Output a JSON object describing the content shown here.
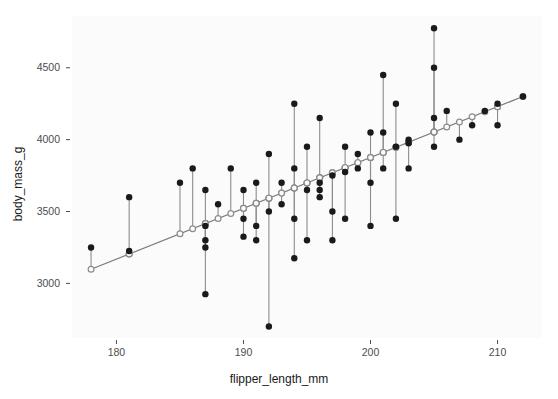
{
  "chart_data": {
    "type": "scatter",
    "title": "",
    "xlabel": "flipper_length_mm",
    "ylabel": "body_mass_g",
    "xlim": [
      176.5,
      213.5
    ],
    "ylim": [
      2620,
      4860
    ],
    "xticks": [
      180,
      190,
      200,
      210
    ],
    "yticks": [
      3000,
      3500,
      4000,
      4500
    ],
    "grid": false,
    "legend": null,
    "series": [
      {
        "name": "observed",
        "marker": "filled-circle",
        "color": "#1a1a1a"
      },
      {
        "name": "fitted",
        "marker": "open-circle",
        "color": "#8c8c8c"
      },
      {
        "name": "residual-segment",
        "marker": "line",
        "color": "#8c8c8c"
      }
    ],
    "regression_line": {
      "x_start": 178.0,
      "y_start": 3098,
      "x_end": 212.0,
      "y_end": 4300,
      "slope": 35.35,
      "intercept": -3194.0,
      "color": "#7a7a7a"
    },
    "points": [
      {
        "x": 178.0,
        "observed": 3250,
        "fitted": 3098
      },
      {
        "x": 181.0,
        "observed": 3600,
        "fitted": 3204
      },
      {
        "x": 181.0,
        "observed": 3225,
        "fitted": 3204
      },
      {
        "x": 185.0,
        "observed": 3700,
        "fitted": 3345
      },
      {
        "x": 186.0,
        "observed": 3800,
        "fitted": 3380
      },
      {
        "x": 187.0,
        "observed": 3650,
        "fitted": 3416
      },
      {
        "x": 187.0,
        "observed": 3400,
        "fitted": 3416
      },
      {
        "x": 187.0,
        "observed": 3300,
        "fitted": 3416
      },
      {
        "x": 187.0,
        "observed": 3250,
        "fitted": 3416
      },
      {
        "x": 187.0,
        "observed": 2925,
        "fitted": 3416
      },
      {
        "x": 188.0,
        "observed": 3550,
        "fitted": 3451
      },
      {
        "x": 189.0,
        "observed": 3800,
        "fitted": 3486
      },
      {
        "x": 190.0,
        "observed": 3650,
        "fitted": 3522
      },
      {
        "x": 190.0,
        "observed": 3450,
        "fitted": 3522
      },
      {
        "x": 190.0,
        "observed": 3325,
        "fitted": 3522
      },
      {
        "x": 191.0,
        "observed": 3700,
        "fitted": 3557
      },
      {
        "x": 191.0,
        "observed": 3400,
        "fitted": 3557
      },
      {
        "x": 191.0,
        "observed": 3300,
        "fitted": 3557
      },
      {
        "x": 192.0,
        "observed": 3900,
        "fitted": 3593
      },
      {
        "x": 192.0,
        "observed": 3500,
        "fitted": 3593
      },
      {
        "x": 192.0,
        "observed": 2700,
        "fitted": 3593
      },
      {
        "x": 193.0,
        "observed": 3700,
        "fitted": 3628
      },
      {
        "x": 193.0,
        "observed": 3550,
        "fitted": 3628
      },
      {
        "x": 194.0,
        "observed": 4250,
        "fitted": 3663
      },
      {
        "x": 194.0,
        "observed": 3800,
        "fitted": 3663
      },
      {
        "x": 194.0,
        "observed": 3450,
        "fitted": 3663
      },
      {
        "x": 194.0,
        "observed": 3175,
        "fitted": 3663
      },
      {
        "x": 195.0,
        "observed": 3950,
        "fitted": 3699
      },
      {
        "x": 195.0,
        "observed": 3650,
        "fitted": 3699
      },
      {
        "x": 195.0,
        "observed": 3300,
        "fitted": 3699
      },
      {
        "x": 196.0,
        "observed": 4150,
        "fitted": 3734
      },
      {
        "x": 196.0,
        "observed": 3700,
        "fitted": 3734
      },
      {
        "x": 196.0,
        "observed": 3650,
        "fitted": 3734
      },
      {
        "x": 196.0,
        "observed": 3600,
        "fitted": 3734
      },
      {
        "x": 197.0,
        "observed": 3750,
        "fitted": 3770
      },
      {
        "x": 197.0,
        "observed": 3500,
        "fitted": 3770
      },
      {
        "x": 197.0,
        "observed": 3300,
        "fitted": 3770
      },
      {
        "x": 198.0,
        "observed": 3950,
        "fitted": 3805
      },
      {
        "x": 198.0,
        "observed": 3775,
        "fitted": 3805
      },
      {
        "x": 198.0,
        "observed": 3450,
        "fitted": 3805
      },
      {
        "x": 199.0,
        "observed": 3900,
        "fitted": 3840
      },
      {
        "x": 199.0,
        "observed": 3800,
        "fitted": 3840
      },
      {
        "x": 200.0,
        "observed": 4050,
        "fitted": 3876
      },
      {
        "x": 200.0,
        "observed": 3700,
        "fitted": 3876
      },
      {
        "x": 200.0,
        "observed": 3400,
        "fitted": 3876
      },
      {
        "x": 201.0,
        "observed": 4450,
        "fitted": 3911
      },
      {
        "x": 201.0,
        "observed": 4050,
        "fitted": 3911
      },
      {
        "x": 201.0,
        "observed": 3800,
        "fitted": 3911
      },
      {
        "x": 202.0,
        "observed": 4250,
        "fitted": 3947
      },
      {
        "x": 202.0,
        "observed": 3950,
        "fitted": 3947
      },
      {
        "x": 202.0,
        "observed": 3450,
        "fitted": 3947
      },
      {
        "x": 203.0,
        "observed": 4000,
        "fitted": 3982
      },
      {
        "x": 203.0,
        "observed": 3975,
        "fitted": 3982
      },
      {
        "x": 203.0,
        "observed": 3800,
        "fitted": 3982
      },
      {
        "x": 205.0,
        "observed": 4775,
        "fitted": 4053
      },
      {
        "x": 205.0,
        "observed": 4500,
        "fitted": 4053
      },
      {
        "x": 205.0,
        "observed": 4150,
        "fitted": 4053
      },
      {
        "x": 205.0,
        "observed": 3950,
        "fitted": 4053
      },
      {
        "x": 206.0,
        "observed": 4200,
        "fitted": 4088
      },
      {
        "x": 207.0,
        "observed": 4000,
        "fitted": 4123
      },
      {
        "x": 208.0,
        "observed": 4100,
        "fitted": 4159
      },
      {
        "x": 209.0,
        "observed": 4200,
        "fitted": 4194
      },
      {
        "x": 210.0,
        "observed": 4250,
        "fitted": 4229
      },
      {
        "x": 210.0,
        "observed": 4100,
        "fitted": 4229
      },
      {
        "x": 212.0,
        "observed": 4300,
        "fitted": 4300
      }
    ]
  },
  "style": {
    "panel_background": "#fbfbfb",
    "page_background": "#ffffff",
    "point_color": "#1a1a1a",
    "fitted_color": "#8c8c8c",
    "segment_color": "#8c8c8c",
    "line_color": "#7a7a7a",
    "tick_text_color": "#4d4d4d",
    "axis_title_color": "#1a1a1a"
  }
}
